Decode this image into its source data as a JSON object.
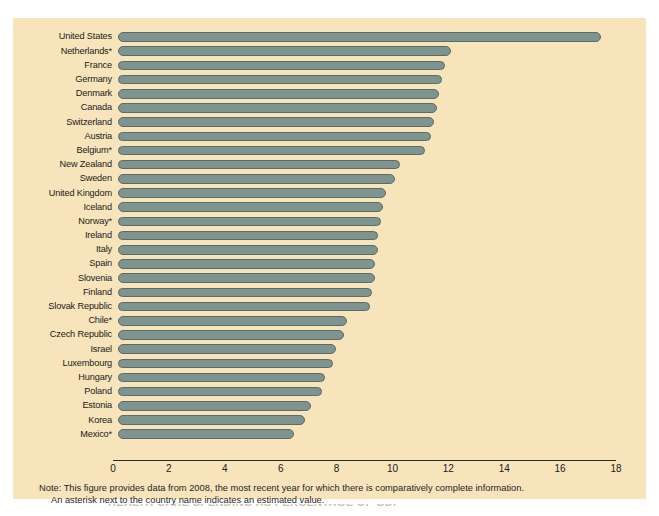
{
  "chart_data": {
    "type": "bar",
    "orientation": "horizontal",
    "title": "",
    "xlabel": "",
    "ylabel": "",
    "xlim": [
      0,
      18
    ],
    "xticks": [
      0,
      2,
      4,
      6,
      8,
      10,
      12,
      14,
      16,
      18
    ],
    "grid": false,
    "legend": null,
    "categories": [
      "United States",
      "Netherlands*",
      "France",
      "Germany",
      "Denmark",
      "Canada",
      "Switzerland",
      "Austria",
      "Belgium*",
      "New Zealand",
      "Sweden",
      "United Kingdom",
      "Iceland",
      "Norway*",
      "Ireland",
      "Italy",
      "Spain",
      "Slovenia",
      "Finland",
      "Slovak Republic",
      "Chile*",
      "Czech Republic",
      "Israel",
      "Luxembourg",
      "Hungary",
      "Poland",
      "Estonia",
      "Korea",
      "Mexico*"
    ],
    "values": [
      17.3,
      11.9,
      11.7,
      11.6,
      11.5,
      11.4,
      11.3,
      11.2,
      11.0,
      10.1,
      9.9,
      9.6,
      9.5,
      9.4,
      9.3,
      9.3,
      9.2,
      9.2,
      9.1,
      9.0,
      8.2,
      8.1,
      7.8,
      7.7,
      7.4,
      7.3,
      6.9,
      6.7,
      6.3
    ]
  },
  "note": {
    "line1": "Note: This figure provides data from 2008, the most recent year for which there is comparatively complete information.",
    "line2": "An asterisk next to the country name indicates an estimated value."
  },
  "caption": {
    "cut_off_text": "HEALTH CARE SPENDING AS PERCENTAGE OF GDP"
  },
  "colors": {
    "page_background": "#ffffff",
    "figure_background": "#f7e4bb",
    "bar_fill": "#7e9490",
    "bar_stroke": "#5d6b64",
    "text": "#1a1a1a",
    "axis": "#2c2c24"
  }
}
